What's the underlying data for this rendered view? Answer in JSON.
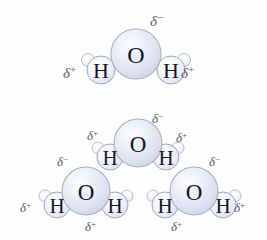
{
  "figure": {
    "background_color": "#fefeff",
    "atom_label_color": "#15131c",
    "delta_color": "#5c5a68",
    "oxygen_fill": "#e2e5f2",
    "oxygen_edge": "#a9aec9",
    "hydrogen_fill": "#eef0f8",
    "hydrogen_edge": "#9ea4c2",
    "lobe_fill": "#f4f5fb"
  },
  "labels": {
    "oxygen": "O",
    "hydrogen": "H",
    "delta_glyph": "δ",
    "plus": "+",
    "minus": "−"
  },
  "molecules": [
    {
      "id": "molecule-top",
      "group": "single",
      "atoms": [
        {
          "element": "O",
          "label": "O"
        },
        {
          "element": "H",
          "label": "H"
        },
        {
          "element": "H",
          "label": "H"
        }
      ],
      "charges": [
        {
          "name": "delta-minus-top-oxygen",
          "sign": "−",
          "text": "δ−",
          "position": "above-right-of-oxygen"
        },
        {
          "name": "delta-plus-top-left-hydrogen",
          "sign": "+",
          "text": "δ+",
          "position": "left-of-left-hydrogen"
        },
        {
          "name": "delta-plus-top-right-hydrogen",
          "sign": "+",
          "text": "δ+",
          "position": "right-of-right-hydrogen"
        }
      ]
    },
    {
      "id": "molecule-cluster-top",
      "group": "cluster",
      "atoms": [
        {
          "element": "O",
          "label": "O"
        },
        {
          "element": "H",
          "label": "H"
        },
        {
          "element": "H",
          "label": "H"
        }
      ],
      "charges": [
        {
          "name": "delta-minus-cluster-top-oxygen",
          "sign": "−",
          "text": "δ−",
          "position": "above-right-of-oxygen"
        },
        {
          "name": "delta-plus-cluster-top-left-hydrogen",
          "sign": "+",
          "text": "δ+",
          "position": "above-left-hydrogen"
        },
        {
          "name": "delta-plus-cluster-top-right-hydrogen",
          "sign": "+",
          "text": "δ+",
          "position": "above-right-hydrogen"
        }
      ]
    },
    {
      "id": "molecule-cluster-left",
      "group": "cluster",
      "atoms": [
        {
          "element": "O",
          "label": "O"
        },
        {
          "element": "H",
          "label": "H"
        },
        {
          "element": "H",
          "label": "H"
        }
      ],
      "charges": [
        {
          "name": "delta-minus-cluster-left-oxygen",
          "sign": "−",
          "text": "δ−",
          "position": "above-left-of-oxygen"
        },
        {
          "name": "delta-plus-cluster-left-left-hydrogen",
          "sign": "+",
          "text": "δ+",
          "position": "left-of-left-hydrogen"
        },
        {
          "name": "delta-plus-cluster-left-right-hydrogen",
          "sign": "+",
          "text": "δ+",
          "position": "below-right-hydrogen"
        }
      ]
    },
    {
      "id": "molecule-cluster-right",
      "group": "cluster",
      "atoms": [
        {
          "element": "O",
          "label": "O"
        },
        {
          "element": "H",
          "label": "H"
        },
        {
          "element": "H",
          "label": "H"
        }
      ],
      "charges": [
        {
          "name": "delta-minus-cluster-right-oxygen",
          "sign": "−",
          "text": "δ−",
          "position": "above-right-of-oxygen"
        },
        {
          "name": "delta-plus-cluster-right-left-hydrogen",
          "sign": "+",
          "text": "δ+",
          "position": "below-left-hydrogen"
        },
        {
          "name": "delta-plus-cluster-right-right-hydrogen",
          "sign": "+",
          "text": "δ+",
          "position": "right-of-right-hydrogen"
        }
      ]
    }
  ],
  "charge_labels": {
    "top_oxygen_minus": "δ−",
    "top_left_plus": "δ+",
    "top_right_plus": "δ+",
    "c_top_oxygen_minus": "δ−",
    "c_top_left_plus": "δ+",
    "c_top_right_plus": "δ+",
    "c_left_oxygen_minus": "δ−",
    "c_left_left_plus": "δ+",
    "c_left_bottom_plus": "δ+",
    "c_right_oxygen_minus": "δ−",
    "c_right_bottom_plus": "δ+",
    "c_right_right_plus": "δ+"
  }
}
